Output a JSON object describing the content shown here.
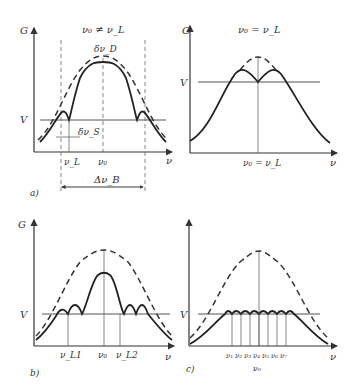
{
  "panels": {
    "a": {
      "tag": "a)",
      "title": "ν₀ ≠ ν_L",
      "y_axis": "G",
      "x_axis": "ν",
      "threshold": "V",
      "labels": {
        "top": "δν_D",
        "hole": "δν_S",
        "nu_L": "ν_L",
        "nu_0": "ν₀",
        "width": "Δν_B"
      }
    },
    "a2": {
      "title": "ν₀ = ν_L",
      "y_axis": "G",
      "x_axis": "ν",
      "threshold": "V",
      "labels": {
        "center": "ν₀ = ν_L"
      }
    },
    "b": {
      "tag": "b)",
      "y_axis": "G",
      "x_axis": "ν",
      "threshold": "V",
      "labels": {
        "nu_L1": "ν_L1",
        "nu_0": "ν₀",
        "nu_L2": "ν_L2"
      }
    },
    "c": {
      "tag": "c)",
      "y_axis": "G",
      "x_axis": "ν",
      "threshold": "V",
      "modes": [
        "ν₁",
        "ν₂",
        "ν₃",
        "ν₄",
        "ν₅",
        "ν₆",
        "ν₇"
      ],
      "center": "ν₀"
    }
  }
}
